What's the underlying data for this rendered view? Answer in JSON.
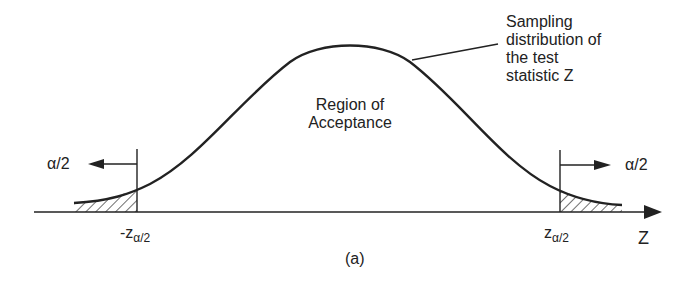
{
  "diagram": {
    "caption": "(a)",
    "curve_label": [
      "Sampling",
      "distribution of",
      "the test",
      "statistic Z"
    ],
    "region_label": [
      "Region of",
      "Acceptance"
    ],
    "left_tail": {
      "arrow_label": "α/2",
      "critical_value": "-z",
      "critical_sub": "α/2"
    },
    "right_tail": {
      "arrow_label": "α/2",
      "critical_value": "z",
      "critical_sub": "α/2"
    },
    "axis_label": "Z"
  },
  "colors": {
    "ink": "#222222",
    "background": "#ffffff"
  }
}
